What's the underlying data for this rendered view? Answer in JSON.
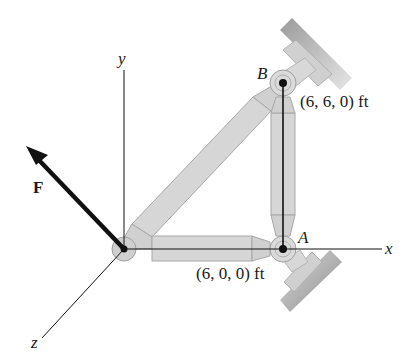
{
  "diagram": {
    "type": "3D truss statics figure",
    "axes": {
      "x_label": "x",
      "y_label": "y",
      "z_label": "z"
    },
    "force": {
      "label": "F"
    },
    "points": {
      "A": {
        "label": "A",
        "coords": "(6, 0, 0) ft"
      },
      "B": {
        "label": "B",
        "coords": "(6, 6, 0) ft"
      }
    },
    "colors": {
      "member_fill": "#d4d4d4",
      "member_stroke": "#a8a8a8",
      "support_dark": "#8c8c8c",
      "line": "#111111"
    }
  }
}
